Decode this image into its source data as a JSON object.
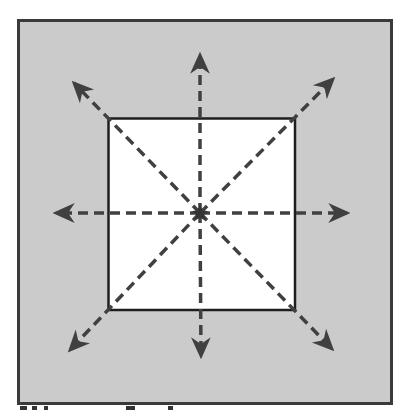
{
  "diagram": {
    "colors": {
      "outer_fill": "#cbcbcb",
      "outer_stroke": "#3a3a3a",
      "inner_fill": "#ffffff",
      "inner_stroke": "#1e1e1e",
      "arrow_color": "#404040"
    },
    "outer_frame": {
      "x": 18,
      "y": 20,
      "width": 374,
      "height": 384
    },
    "inner_square": {
      "x": 108,
      "y": 118,
      "width": 187,
      "height": 192
    },
    "center": {
      "x": 200,
      "y": 213
    },
    "arrows": [
      {
        "name": "arrow-up",
        "direction": "up",
        "tip": [
          200,
          53
        ]
      },
      {
        "name": "arrow-down",
        "direction": "down",
        "tip": [
          201,
          358
        ]
      },
      {
        "name": "arrow-left",
        "direction": "left",
        "tip": [
          54,
          213
        ]
      },
      {
        "name": "arrow-right",
        "direction": "right",
        "tip": [
          349,
          213
        ]
      },
      {
        "name": "arrow-up-left",
        "direction": "up-left",
        "tip": [
          72,
          81
        ]
      },
      {
        "name": "arrow-up-right",
        "direction": "up-right",
        "tip": [
          335,
          77
        ]
      },
      {
        "name": "arrow-down-left",
        "direction": "down-left",
        "tip": [
          68,
          352
        ]
      },
      {
        "name": "arrow-down-right",
        "direction": "down-right",
        "tip": [
          334,
          351
        ]
      }
    ],
    "line_style": "dashed",
    "center_marker": "star"
  }
}
